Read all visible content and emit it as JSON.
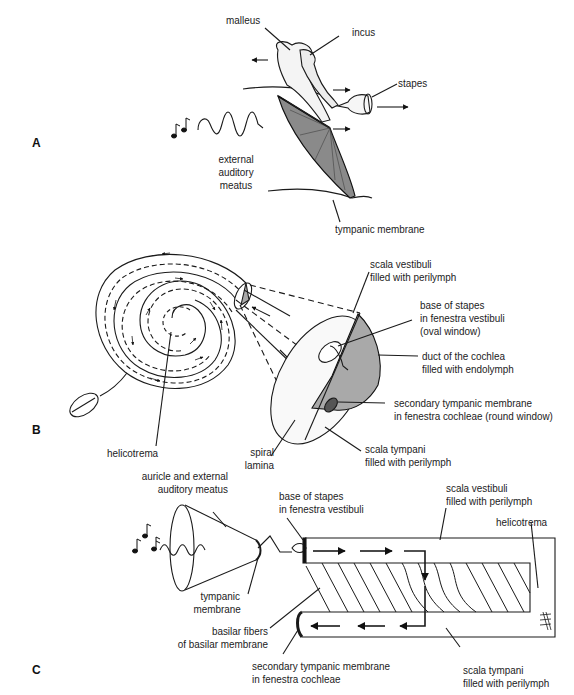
{
  "figure": {
    "panels": [
      {
        "id": "A",
        "labels": {
          "malleus": "malleus",
          "incus": "incus",
          "stapes": "stapes",
          "external_auditory_meatus": [
            "external",
            "auditory",
            "meatus"
          ],
          "tympanic_membrane": "tympanic membrane"
        }
      },
      {
        "id": "B",
        "labels": {
          "scala_vestibuli": [
            "scala vestibuli",
            "filled with perilymph"
          ],
          "base_of_stapes": [
            "base of stapes",
            "in fenestra vestibuli",
            "(oval window)"
          ],
          "duct_of_cochlea": [
            "duct of the cochlea",
            "filled with endolymph"
          ],
          "secondary_tympanic_membrane": [
            "secondary tympanic membrane",
            "in fenestra cochleae (round window)"
          ],
          "scala_tympani": [
            "scala tympani",
            "filled with perilymph"
          ],
          "spiral_lamina": [
            "spiral",
            "lamina"
          ],
          "helicotrema": "helicotrema"
        }
      },
      {
        "id": "C",
        "labels": {
          "auricle": [
            "auricle and external",
            "auditory meatus"
          ],
          "tympanic_membrane": [
            "tympanic",
            "membrane"
          ],
          "base_of_stapes": [
            "base of stapes",
            "in fenestra vestibuli"
          ],
          "scala_vestibuli": [
            "scala vestibuli",
            "filled with perilymph"
          ],
          "helicotrema": "helicotrema",
          "basilar_fibers": [
            "basilar fibers",
            "of basilar membrane"
          ],
          "secondary_tympanic_membrane": [
            "secondary tympanic membrane",
            "in fenestra cochleae"
          ],
          "scala_tympani": [
            "scala tympani",
            "filled with perilymph"
          ]
        }
      }
    ],
    "colors": {
      "line": "#1a1a1a",
      "shade": "#a9a9a9",
      "membrane_fill": "#8a8a8a",
      "background": "#ffffff"
    }
  }
}
